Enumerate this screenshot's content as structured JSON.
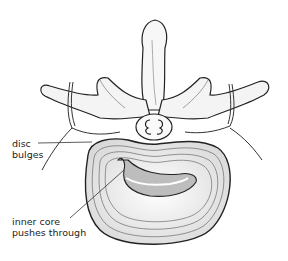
{
  "diagram": {
    "labels": [
      {
        "id": "disc-bulges",
        "lines": [
          "disc",
          "bulges"
        ]
      },
      {
        "id": "inner-core",
        "lines": [
          "inner core",
          "pushes through"
        ]
      }
    ],
    "colors": {
      "ink": "#222222",
      "shade": "#9a9a9a",
      "background": "#ffffff",
      "core_fill": "#bdbdbd"
    }
  }
}
